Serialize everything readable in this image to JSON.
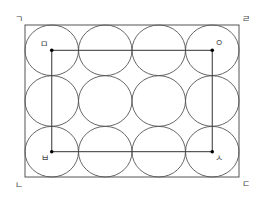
{
  "diagram": {
    "colors": {
      "stroke": "#555555",
      "dot": "#000000",
      "background": "#ffffff"
    },
    "outer_rect": {
      "x": 25,
      "y": 25,
      "width": 214,
      "height": 152
    },
    "grid": {
      "columns": 4,
      "rows": 3
    },
    "circles": [
      {
        "cx": 51.75,
        "cy": 50.3
      },
      {
        "cx": 105.25,
        "cy": 50.3
      },
      {
        "cx": 158.75,
        "cy": 50.3
      },
      {
        "cx": 212.25,
        "cy": 50.3
      },
      {
        "cx": 51.75,
        "cy": 101
      },
      {
        "cx": 105.25,
        "cy": 101
      },
      {
        "cx": 158.75,
        "cy": 101
      },
      {
        "cx": 212.25,
        "cy": 101
      },
      {
        "cx": 51.75,
        "cy": 151.7
      },
      {
        "cx": 105.25,
        "cy": 151.7
      },
      {
        "cx": 158.75,
        "cy": 151.7
      },
      {
        "cx": 212.25,
        "cy": 151.7
      }
    ],
    "circle_rx": 26.75,
    "circle_ry": 25.3,
    "inner_rect": {
      "x1": 51.75,
      "y1": 50.3,
      "x2": 212.25,
      "y2": 151.7
    },
    "corner_labels": {
      "top_left": "ㄱ",
      "top_right": "ㄹ",
      "bottom_left": "ㄴ",
      "bottom_right": "ㄷ"
    },
    "inner_labels": {
      "top_left": "ㅁ",
      "top_right": "ㅇ",
      "bottom_left": "ㅂ",
      "bottom_right": "ㅅ"
    }
  }
}
